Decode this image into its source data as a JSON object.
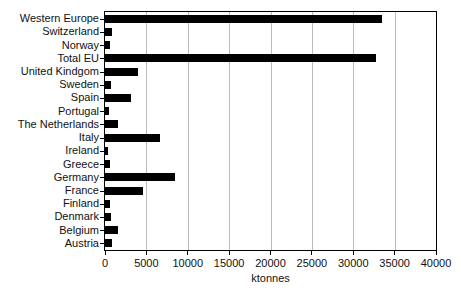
{
  "figure": {
    "background_color": "#ffffff",
    "bar_color": "#000000",
    "grid_color": "#bbbbbb",
    "axis_color": "#000000",
    "text_color": "#111111"
  },
  "chart_data": {
    "type": "bar",
    "orientation": "horizontal",
    "title": "",
    "xlabel": "ktonnes",
    "ylabel": "",
    "xlim": [
      0,
      40000
    ],
    "xticks": [
      0,
      5000,
      10000,
      15000,
      20000,
      25000,
      30000,
      35000,
      40000
    ],
    "grid": "vertical gridlines at each x tick",
    "legend": null,
    "categories_order": "top-to-bottom",
    "categories": [
      "Western Europe",
      "Switzerland",
      "Norway",
      "Total EU",
      "United Kindgom",
      "Sweden",
      "Spain",
      "Portugal",
      "The Netherlands",
      "Italy",
      "Ireland",
      "Greece",
      "Germany",
      "France",
      "Finland",
      "Denmark",
      "Belgium",
      "Austria"
    ],
    "values": [
      33500,
      800,
      550,
      32800,
      4000,
      750,
      3100,
      450,
      1600,
      6700,
      350,
      550,
      8500,
      4550,
      650,
      750,
      1600,
      850
    ]
  }
}
